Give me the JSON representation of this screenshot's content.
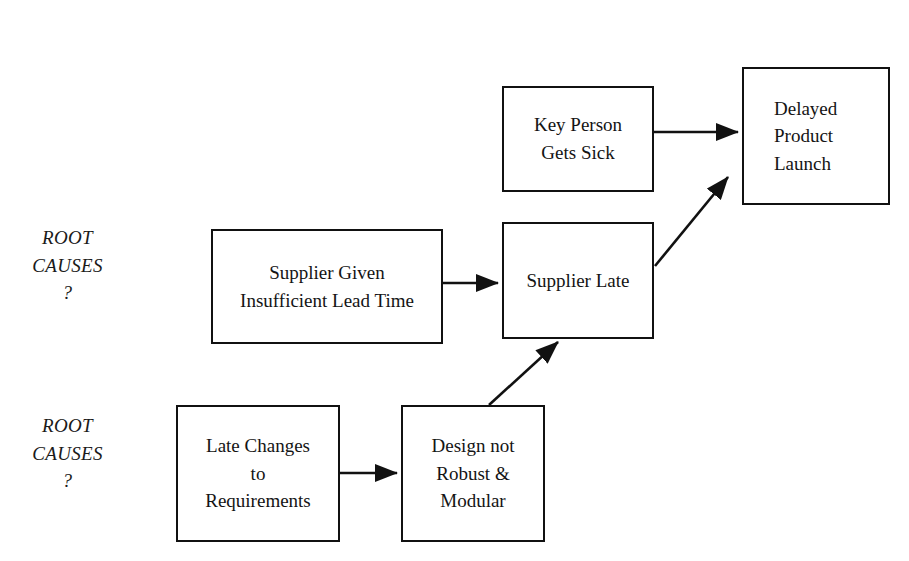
{
  "diagram": {
    "background_color": "#ffffff",
    "line_color": "#111111",
    "text_color": "#141414",
    "annotations": [
      {
        "id": "root-causes-upper",
        "text": "ROOT\nCAUSES\n?",
        "x": 25,
        "y": 224
      },
      {
        "id": "root-causes-lower",
        "text": "ROOT\nCAUSES\n?",
        "x": 25,
        "y": 412
      }
    ],
    "nodes": [
      {
        "id": "key-person-gets-sick",
        "label": "Key Person Gets Sick",
        "lines": [
          "Key Person",
          "Gets Sick"
        ],
        "x": 502,
        "y": 86,
        "width": 152,
        "height": 106,
        "align": "center"
      },
      {
        "id": "delayed-product-launch",
        "label": "Delayed Product Launch",
        "lines": [
          "Delayed",
          "Product",
          "Launch"
        ],
        "x": 742,
        "y": 67,
        "width": 148,
        "height": 138,
        "align": "left"
      },
      {
        "id": "supplier-given-insufficient-lead-time",
        "label": "Supplier Given Insufficient Lead Time",
        "lines": [
          "Supplier Given",
          "Insufficient Lead Time"
        ],
        "x": 211,
        "y": 229,
        "width": 232,
        "height": 115,
        "align": "center"
      },
      {
        "id": "supplier-late",
        "label": "Supplier Late",
        "lines": [
          "Supplier Late"
        ],
        "x": 502,
        "y": 222,
        "width": 152,
        "height": 117,
        "align": "center"
      },
      {
        "id": "late-changes-to-requirements",
        "label": "Late Changes to Requirements",
        "lines": [
          "Late Changes",
          "to",
          "Requirements"
        ],
        "x": 176,
        "y": 405,
        "width": 164,
        "height": 137,
        "align": "center"
      },
      {
        "id": "design-not-robust-and-modular",
        "label": "Design not Robust & Modular",
        "lines": [
          "Design not",
          "Robust &",
          "Modular"
        ],
        "x": 401,
        "y": 405,
        "width": 144,
        "height": 137,
        "align": "center"
      }
    ],
    "edges": [
      {
        "id": "edge-key-person-to-delayed",
        "from": "key-person-gets-sick",
        "to": "delayed-product-launch",
        "kind": "straight-horizontal",
        "x1": 654,
        "y1": 132,
        "x2": 738,
        "y2": 132
      },
      {
        "id": "edge-supplier-late-to-delayed",
        "from": "supplier-late",
        "to": "delayed-product-launch",
        "kind": "diagonal",
        "x1": 655,
        "y1": 266,
        "x2": 728,
        "y2": 177
      },
      {
        "id": "edge-supplier-given-to-supplier-late",
        "from": "supplier-given-insufficient-lead-time",
        "to": "supplier-late",
        "kind": "straight-horizontal",
        "x1": 443,
        "y1": 283,
        "x2": 498,
        "y2": 283
      },
      {
        "id": "edge-design-to-supplier-late",
        "from": "design-not-robust-and-modular",
        "to": "supplier-late",
        "kind": "diagonal",
        "x1": 489,
        "y1": 405,
        "x2": 558,
        "y2": 342
      },
      {
        "id": "edge-late-changes-to-design",
        "from": "late-changes-to-requirements",
        "to": "design-not-robust-and-modular",
        "kind": "straight-horizontal",
        "x1": 340,
        "y1": 473,
        "x2": 397,
        "y2": 473
      }
    ]
  }
}
